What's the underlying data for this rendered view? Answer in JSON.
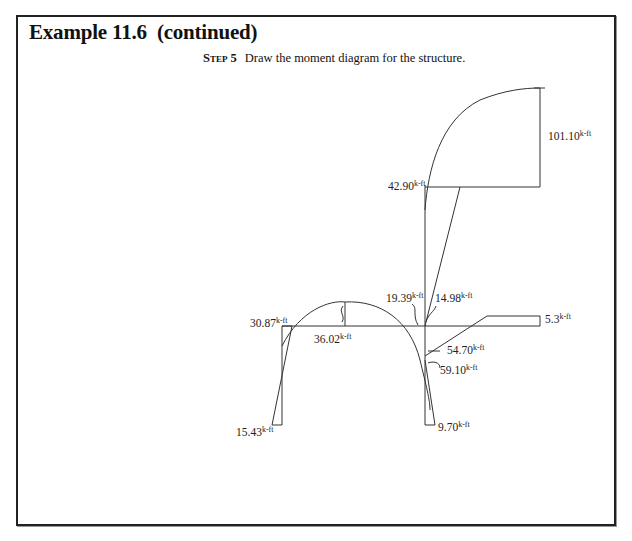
{
  "header": {
    "title": "Example 11.6  (continued)"
  },
  "step": {
    "label": "Step 5",
    "text": "Draw the moment diagram for the structure."
  },
  "diagram": {
    "type": "bending-moment-diagram",
    "unit_suffix": "k-ft",
    "moments": [
      {
        "id": "top-right",
        "value": "101.10"
      },
      {
        "id": "right-column-top",
        "value": "42.90"
      },
      {
        "id": "right-joint-a",
        "value": "19.39"
      },
      {
        "id": "right-joint-b",
        "value": "14.98"
      },
      {
        "id": "overhang",
        "value": "5.3"
      },
      {
        "id": "left-joint",
        "value": "30.87"
      },
      {
        "id": "beam-midspan",
        "value": "36.02"
      },
      {
        "id": "right-joint-c",
        "value": "54.70"
      },
      {
        "id": "right-joint-d",
        "value": "59.10"
      },
      {
        "id": "left-base",
        "value": "15.43"
      },
      {
        "id": "right-base",
        "value": "9.70"
      }
    ]
  }
}
